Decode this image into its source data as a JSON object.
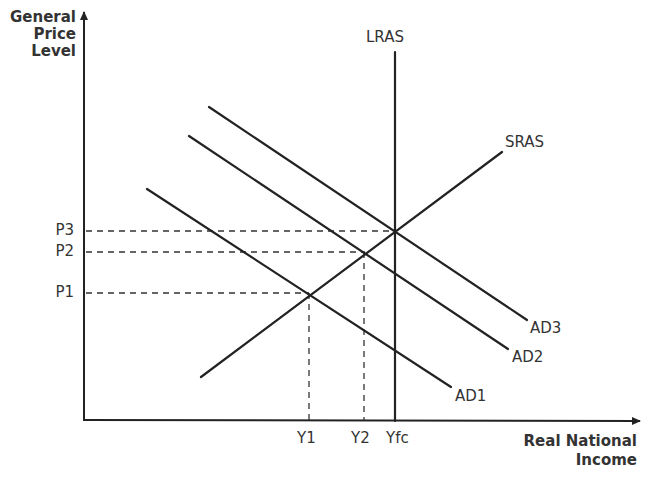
{
  "diagram": {
    "type": "AD-AS macroeconomic diagram",
    "y_axis_label": [
      "General",
      "Price",
      "Level"
    ],
    "x_axis_label": [
      "Real National",
      "Income"
    ],
    "curves": {
      "lras": "LRAS",
      "sras": "SRAS",
      "ad1": "AD1",
      "ad2": "AD2",
      "ad3": "AD3"
    },
    "price_levels": [
      "P3",
      "P2",
      "P1"
    ],
    "output_levels": [
      "Y1",
      "Y2",
      "Yfc"
    ],
    "colors": {
      "line": "#222222",
      "text": "#333333",
      "background": "#ffffff"
    }
  }
}
